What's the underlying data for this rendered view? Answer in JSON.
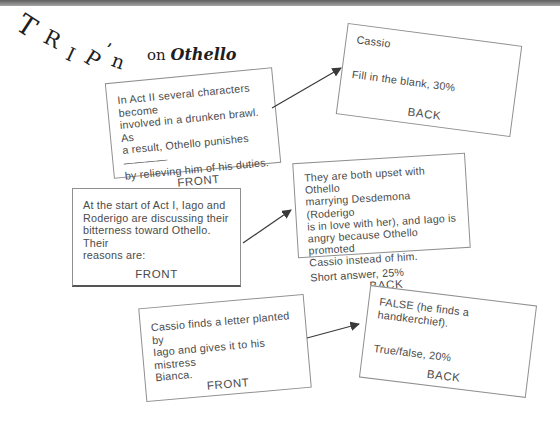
{
  "colors": {
    "top_bar": "#5e5e5e",
    "card_border": "#8f8f8f",
    "card_text": "#4b4b4b"
  },
  "title": {
    "letters": [
      "T",
      "R",
      "I",
      "P",
      "’",
      "n"
    ],
    "subtitle_prefix": "on",
    "subtitle_book": "Othello"
  },
  "cards": [
    {
      "id": "card1-front",
      "body": "In Act II several characters become\ninvolved in a drunken brawl. As\na result, Othello punishes ————\nby relieving him of his duties.",
      "label": "FRONT"
    },
    {
      "id": "card1-back",
      "answer": "Cassio",
      "meta": "Fill in the blank, 30%",
      "label": "BACK"
    },
    {
      "id": "card2-front",
      "body": "At the start of Act I, Iago and\nRoderigo are discussing their\nbitterness toward Othello. Their\nreasons are:",
      "label": "FRONT"
    },
    {
      "id": "card2-back",
      "answer": "They are both upset with Othello\nmarrying Desdemona (Roderigo\nis in love with her), and Iago is\nangry because Othello promoted\nCassio instead of him.",
      "meta": "Short answer, 25%",
      "label": "BACK"
    },
    {
      "id": "card3-front",
      "body": "Cassio finds a letter planted by\nIago and gives it to his mistress\nBianca.",
      "label": "FRONT"
    },
    {
      "id": "card3-back",
      "answer": "FALSE (he finds a handkerchief).",
      "meta": "True/false, 20%",
      "label": "BACK"
    }
  ]
}
